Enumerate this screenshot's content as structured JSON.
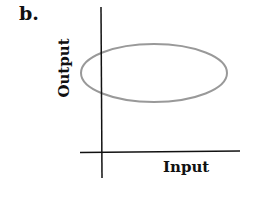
{
  "panel_label": "b.",
  "axes": {
    "x_label": "Input",
    "y_label": "Output",
    "axis_color": "#111111"
  },
  "shape": {
    "type": "ellipse",
    "stroke_color": "#999999",
    "description": "horizontal ellipse in output–input space crossing the y-axis"
  }
}
